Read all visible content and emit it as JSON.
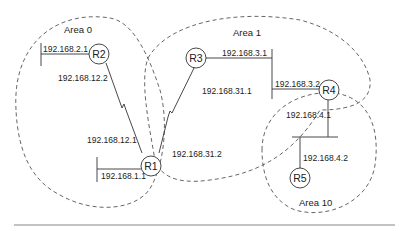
{
  "diagram": {
    "areas": [
      {
        "id": "area0",
        "label": "Area 0"
      },
      {
        "id": "area1",
        "label": "Area 1"
      },
      {
        "id": "area10",
        "label": "Area 10"
      }
    ],
    "routers": [
      {
        "id": "R1",
        "label": "R1"
      },
      {
        "id": "R2",
        "label": "R2"
      },
      {
        "id": "R3",
        "label": "R3"
      },
      {
        "id": "R4",
        "label": "R4"
      },
      {
        "id": "R5",
        "label": "R5"
      }
    ],
    "addresses": {
      "r2_lan": "192.168.2.1",
      "r2_serial": "192.168.12.2",
      "r1_serial_r2": "192.168.12.1",
      "r1_lan": "192.168.1.1",
      "r3_serial": "192.168.31.1",
      "r1_serial_r3": "192.168.31.2",
      "r3_lan": "192.168.3.1",
      "r4_lan3": "192.168.3.2",
      "r4_lan4": "192.168.4.1",
      "r5_lan4": "192.168.4.2"
    },
    "colors": {
      "line": "#333333",
      "dash": "#555555",
      "rule": "#888888"
    }
  }
}
